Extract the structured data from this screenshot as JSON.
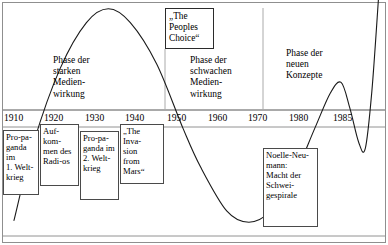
{
  "figure": {
    "title_visible": false,
    "border_color": "#8f8f8f",
    "background": "#ffffff"
  },
  "chart_data": {
    "type": "line",
    "title": "",
    "subtitle": "",
    "xlabel": "",
    "ylabel": "",
    "grid": false,
    "legend_position": "none",
    "xlim": [
      1905,
      1992
    ],
    "ylim": [
      -1.25,
      1.25
    ],
    "axis_baseline_year_range": [
      1908,
      1990
    ],
    "tick_labels": [
      "1910",
      "1920",
      "1930",
      "1940",
      "1950",
      "1960",
      "1970",
      "1980",
      "1985"
    ],
    "tick_years": [
      1910,
      1920,
      1930,
      1940,
      1950,
      1960,
      1970,
      1980,
      1985
    ],
    "series": [
      {
        "name": "Einschaetzung der Medienwirkung",
        "description": "Wellenfoermiger Verlauf der angenommenen Staerke der Medienwirkung im Zeitverlauf",
        "points": [
          {
            "x": 1907.5,
            "y": -1.2
          },
          {
            "x": 1912,
            "y": -0.35
          },
          {
            "x": 1918,
            "y": 0.45
          },
          {
            "x": 1924,
            "y": 0.95
          },
          {
            "x": 1929,
            "y": 1.1
          },
          {
            "x": 1934,
            "y": 0.95
          },
          {
            "x": 1940,
            "y": 0.5
          },
          {
            "x": 1946,
            "y": -0.2
          },
          {
            "x": 1950,
            "y": -0.62
          },
          {
            "x": 1956,
            "y": -1.1
          },
          {
            "x": 1961,
            "y": -1.22
          },
          {
            "x": 1966,
            "y": -1.1
          },
          {
            "x": 1971,
            "y": -0.75
          },
          {
            "x": 1976,
            "y": -0.2
          },
          {
            "x": 1979.5,
            "y": 0.18
          },
          {
            "x": 1982,
            "y": 0.3
          },
          {
            "x": 1984,
            "y": 0.02
          },
          {
            "x": 1986,
            "y": -0.35
          },
          {
            "x": 1987.5,
            "y": -0.42
          },
          {
            "x": 1989,
            "y": 0.2
          },
          {
            "x": 1990.5,
            "y": 1.2
          }
        ]
      }
    ],
    "phase_annotations": [
      {
        "id": "phase-strong",
        "text": "Phase der\nstarken\nMedien-\nwirkung"
      },
      {
        "id": "phase-weak",
        "text": "Phase der\nschwachen\nMedien-\nwirkung"
      },
      {
        "id": "phase-new",
        "text": "Phase der\nneuen\nKonzepte"
      }
    ],
    "phase_dividers_years": [
      1950,
      1970
    ]
  },
  "phases": [
    {
      "name": "phase-strong",
      "label": "Phase der\nstarken\nMedien-\nwirkung",
      "left": 53,
      "top": 55
    },
    {
      "name": "phase-weak",
      "label": "Phase der\nschwachen\nMedien-\nwirkung",
      "left": 190,
      "top": 55
    },
    {
      "name": "phase-new",
      "label": "Phase der\nneuen\nKonzepte",
      "left": 286,
      "top": 48
    }
  ],
  "quote_box": {
    "name": "peoples-choice-box",
    "label": "„The\nPeoples\nChoice“",
    "left": 165,
    "top": 8,
    "width": 49,
    "height": 41
  },
  "event_boxes": [
    {
      "name": "event-box-propaganda-ww1",
      "label": "Pro-pa-\nganda im\n1. Welt-\nkrieg",
      "left": 3,
      "top": 130,
      "width": 36,
      "height": 65
    },
    {
      "name": "event-box-radio",
      "label": "Auf-\nkom-\nmen des\nRadi-os",
      "left": 40,
      "top": 124,
      "width": 39,
      "height": 62
    },
    {
      "name": "event-box-propaganda-ww2",
      "label": "Pro-pa-\nganda im\n2. Welt-\nkrieg",
      "left": 80,
      "top": 131,
      "width": 39,
      "height": 69
    },
    {
      "name": "event-box-invasion-from-mars",
      "label": "„The\nInva-\nsion\nfrom\nMars“",
      "left": 120,
      "top": 124,
      "width": 44,
      "height": 60
    },
    {
      "name": "event-box-noelle-neumann",
      "label": "Noelle-Neu-\nmann:\nMacht der\nSchwei-\ngespirale",
      "left": 263,
      "top": 148,
      "width": 55,
      "height": 79
    }
  ],
  "axis": {
    "name": "timeline-axis",
    "ticks": [
      {
        "label": "1910",
        "left": 4
      },
      {
        "label": "1920",
        "left": 44
      },
      {
        "label": "1930",
        "left": 85
      },
      {
        "label": "1940",
        "left": 125
      },
      {
        "label": "1950",
        "left": 167
      },
      {
        "label": "1960",
        "left": 208
      },
      {
        "label": "1970",
        "left": 248
      },
      {
        "label": "1980",
        "left": 289
      },
      {
        "label": "1985",
        "left": 333
      }
    ]
  },
  "colors": {
    "curve": "#1a1a1a",
    "axis": "#555555",
    "divider": "#aaaaaa",
    "box_border": "#4a4a4a",
    "frame": "#8f8f8f",
    "text": "#000000"
  }
}
